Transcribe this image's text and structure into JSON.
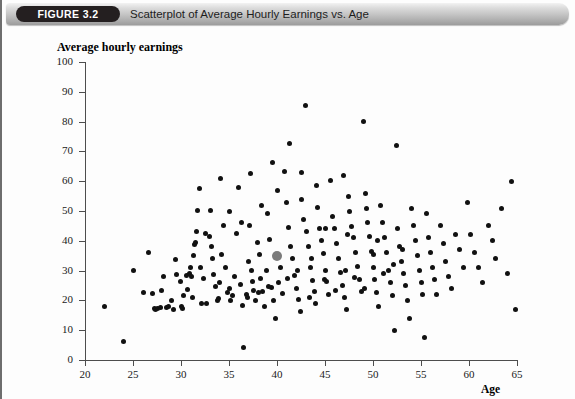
{
  "header": {
    "badge": "FIGURE 3.2",
    "title": "Scatterplot of Average Hourly Earnings vs. Age",
    "bar_color": "#c2c2c2",
    "badge_color": "#241f20"
  },
  "chart_data": {
    "type": "scatter",
    "title": "Scatterplot of Average Hourly Earnings vs. Age",
    "xlabel": "Age",
    "ylabel": "Average hourly earnings",
    "xlim": [
      20,
      65
    ],
    "ylim": [
      0,
      100
    ],
    "xticks": [
      20,
      25,
      30,
      35,
      40,
      45,
      50,
      55,
      60,
      65
    ],
    "yticks": [
      0,
      10,
      20,
      30,
      40,
      50,
      60,
      70,
      80,
      90,
      100
    ],
    "grid": false,
    "legend": null,
    "marker_color": "#111111",
    "highlight_color": "#7b7b7b",
    "highlight_point": {
      "x": 40,
      "y": 35,
      "note": "highlighted observation"
    },
    "series": [
      {
        "name": "observations",
        "points": [
          [
            22.0,
            17.9
          ],
          [
            24.0,
            6.2
          ],
          [
            25.0,
            30.1
          ],
          [
            26.1,
            22.6
          ],
          [
            26.6,
            36.0
          ],
          [
            27.0,
            22.4
          ],
          [
            27.2,
            17.3
          ],
          [
            27.3,
            16.9
          ],
          [
            27.6,
            17.4
          ],
          [
            27.9,
            17.6
          ],
          [
            28.0,
            23.3
          ],
          [
            28.5,
            17.6
          ],
          [
            28.7,
            17.8
          ],
          [
            29.2,
            17.1
          ],
          [
            29.4,
            33.7
          ],
          [
            29.5,
            28.6
          ],
          [
            29.9,
            26.2
          ],
          [
            30.3,
            21.5
          ],
          [
            30.6,
            28.2
          ],
          [
            30.7,
            23.6
          ],
          [
            30.9,
            28.9
          ],
          [
            31.0,
            30.9
          ],
          [
            31.1,
            27.9
          ],
          [
            31.2,
            21.0
          ],
          [
            31.4,
            38.6
          ],
          [
            31.5,
            39.3
          ],
          [
            31.6,
            43.0
          ],
          [
            31.7,
            50.2
          ],
          [
            31.9,
            57.7
          ],
          [
            32.0,
            31.0
          ],
          [
            32.3,
            27.2
          ],
          [
            32.5,
            42.3
          ],
          [
            32.7,
            18.9
          ],
          [
            33.0,
            41.6
          ],
          [
            33.1,
            50.1
          ],
          [
            33.2,
            38.2
          ],
          [
            33.4,
            28.6
          ],
          [
            33.6,
            24.7
          ],
          [
            33.8,
            19.9
          ],
          [
            34.0,
            26.0
          ],
          [
            34.2,
            35.3
          ],
          [
            34.4,
            45.0
          ],
          [
            34.6,
            31.1
          ],
          [
            34.8,
            22.6
          ],
          [
            35.0,
            49.8
          ],
          [
            35.2,
            20.1
          ],
          [
            35.4,
            21.6
          ],
          [
            35.6,
            28.0
          ],
          [
            35.8,
            42.3
          ],
          [
            36.0,
            57.9
          ],
          [
            36.2,
            25.4
          ],
          [
            36.4,
            18.3
          ],
          [
            36.5,
            4.3
          ],
          [
            36.8,
            22.1
          ],
          [
            37.0,
            33.1
          ],
          [
            37.1,
            45.0
          ],
          [
            37.3,
            29.9
          ],
          [
            37.4,
            26.3
          ],
          [
            37.6,
            23.3
          ],
          [
            37.8,
            20.0
          ],
          [
            38.0,
            39.4
          ],
          [
            38.2,
            35.3
          ],
          [
            38.3,
            27.5
          ],
          [
            38.5,
            23.0
          ],
          [
            38.7,
            18.1
          ],
          [
            38.9,
            30.1
          ],
          [
            39.0,
            49.3
          ],
          [
            39.2,
            40.4
          ],
          [
            39.4,
            24.2
          ],
          [
            39.6,
            19.8
          ],
          [
            39.8,
            14.0
          ],
          [
            40.0,
            35.0
          ],
          [
            40.2,
            26.0
          ],
          [
            40.4,
            31.1
          ],
          [
            40.6,
            22.4
          ],
          [
            40.8,
            63.1
          ],
          [
            41.0,
            53.0
          ],
          [
            41.2,
            44.6
          ],
          [
            41.4,
            38.0
          ],
          [
            41.6,
            33.9
          ],
          [
            41.8,
            28.2
          ],
          [
            42.0,
            24.0
          ],
          [
            42.2,
            20.2
          ],
          [
            42.4,
            16.4
          ],
          [
            42.6,
            54.0
          ],
          [
            42.8,
            47.2
          ],
          [
            43.0,
            85.3
          ],
          [
            43.1,
            43.0
          ],
          [
            43.3,
            38.2
          ],
          [
            43.5,
            31.0
          ],
          [
            43.7,
            26.7
          ],
          [
            43.9,
            23.0
          ],
          [
            44.0,
            18.9
          ],
          [
            44.2,
            51.2
          ],
          [
            44.4,
            44.0
          ],
          [
            44.6,
            40.0
          ],
          [
            44.8,
            35.6
          ],
          [
            45.0,
            30.2
          ],
          [
            45.2,
            26.3
          ],
          [
            45.4,
            22.0
          ],
          [
            45.6,
            60.4
          ],
          [
            45.8,
            48.1
          ],
          [
            46.0,
            44.0
          ],
          [
            46.2,
            39.0
          ],
          [
            46.4,
            34.0
          ],
          [
            46.6,
            29.4
          ],
          [
            46.8,
            25.0
          ],
          [
            47.0,
            21.0
          ],
          [
            47.2,
            17.0
          ],
          [
            47.4,
            55.0
          ],
          [
            47.6,
            50.0
          ],
          [
            47.8,
            44.8
          ],
          [
            48.0,
            41.0
          ],
          [
            48.2,
            36.0
          ],
          [
            48.4,
            31.5
          ],
          [
            48.6,
            27.0
          ],
          [
            48.8,
            23.0
          ],
          [
            49.0,
            80.2
          ],
          [
            49.2,
            56.0
          ],
          [
            49.4,
            46.0
          ],
          [
            49.6,
            41.3
          ],
          [
            49.8,
            36.4
          ],
          [
            50.0,
            31.0
          ],
          [
            50.2,
            27.0
          ],
          [
            50.4,
            22.5
          ],
          [
            50.6,
            18.0
          ],
          [
            50.8,
            52.0
          ],
          [
            51.0,
            46.2
          ],
          [
            51.2,
            41.0
          ],
          [
            51.4,
            36.0
          ],
          [
            51.6,
            30.0
          ],
          [
            51.8,
            26.0
          ],
          [
            52.0,
            21.8
          ],
          [
            52.2,
            10.0
          ],
          [
            52.4,
            72.0
          ],
          [
            52.6,
            44.0
          ],
          [
            52.8,
            38.0
          ],
          [
            53.0,
            33.0
          ],
          [
            53.2,
            29.0
          ],
          [
            53.4,
            25.0
          ],
          [
            53.6,
            20.0
          ],
          [
            53.8,
            14.0
          ],
          [
            54.0,
            51.0
          ],
          [
            54.2,
            45.0
          ],
          [
            54.4,
            40.0
          ],
          [
            54.6,
            35.0
          ],
          [
            54.8,
            30.0
          ],
          [
            55.0,
            26.0
          ],
          [
            55.2,
            22.0
          ],
          [
            55.4,
            7.5
          ],
          [
            55.6,
            49.0
          ],
          [
            55.8,
            41.0
          ],
          [
            56.0,
            36.0
          ],
          [
            56.2,
            31.0
          ],
          [
            56.4,
            27.0
          ],
          [
            56.6,
            22.0
          ],
          [
            57.0,
            45.0
          ],
          [
            57.3,
            39.0
          ],
          [
            57.6,
            33.0
          ],
          [
            57.9,
            28.0
          ],
          [
            58.2,
            24.0
          ],
          [
            58.6,
            42.0
          ],
          [
            59.0,
            37.0
          ],
          [
            59.4,
            31.0
          ],
          [
            59.8,
            53.0
          ],
          [
            60.2,
            42.0
          ],
          [
            60.6,
            36.0
          ],
          [
            61.0,
            31.0
          ],
          [
            61.4,
            26.0
          ],
          [
            62.0,
            45.0
          ],
          [
            62.4,
            40.0
          ],
          [
            62.8,
            34.0
          ],
          [
            63.4,
            51.0
          ],
          [
            64.0,
            29.0
          ],
          [
            64.4,
            59.8
          ],
          [
            64.8,
            16.8
          ],
          [
            30.0,
            17.8
          ],
          [
            30.2,
            17.2
          ],
          [
            32.1,
            19.0
          ],
          [
            33.9,
            20.6
          ],
          [
            35.1,
            24.0
          ],
          [
            36.9,
            21.0
          ],
          [
            38.1,
            22.6
          ],
          [
            39.1,
            24.6
          ],
          [
            41.1,
            27.2
          ],
          [
            42.1,
            30.2
          ],
          [
            43.6,
            34.2
          ],
          [
            44.9,
            27.0
          ],
          [
            46.1,
            23.4
          ],
          [
            47.1,
            30.0
          ],
          [
            48.1,
            27.6
          ],
          [
            49.1,
            24.0
          ],
          [
            50.1,
            35.5
          ],
          [
            51.1,
            29.0
          ],
          [
            52.1,
            32.0
          ],
          [
            53.1,
            37.0
          ],
          [
            44.1,
            58.6
          ],
          [
            46.9,
            62.0
          ],
          [
            41.3,
            72.5
          ],
          [
            39.5,
            66.3
          ],
          [
            37.2,
            62.6
          ],
          [
            34.1,
            61.0
          ],
          [
            43.4,
            21.0
          ],
          [
            45.1,
            44.0
          ],
          [
            47.3,
            42.0
          ],
          [
            49.3,
            51.0
          ],
          [
            50.5,
            40.0
          ],
          [
            36.3,
            46.0
          ],
          [
            38.4,
            52.0
          ],
          [
            40.1,
            57.0
          ],
          [
            42.5,
            63.0
          ],
          [
            33.3,
            34.0
          ],
          [
            31.3,
            35.0
          ],
          [
            29.0,
            20.0
          ],
          [
            28.2,
            28.0
          ]
        ]
      }
    ]
  }
}
